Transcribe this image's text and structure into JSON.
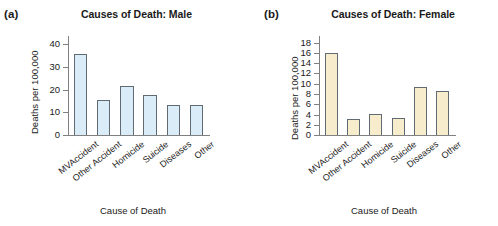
{
  "figure": {
    "panels": [
      {
        "panel_label": "(a)",
        "title": "Causes of Death: Male",
        "ylabel": "Deaths per 100,000",
        "xlabel": "Cause of Death",
        "bar_color": "#d9ecf7",
        "bar_edge_color": "#5f6a72"
      },
      {
        "panel_label": "(b)",
        "title": "Causes of Death: Female",
        "ylabel": "Deaths per 100,000",
        "xlabel": "Cause of Death",
        "bar_color": "#f7edcd",
        "bar_edge_color": "#5f6a72"
      }
    ]
  },
  "chart_data": [
    {
      "type": "bar",
      "title": "Causes of Death: Male",
      "panel": "(a)",
      "xlabel": "Cause of Death",
      "ylabel": "Deaths per 100,000",
      "categories": [
        "MVAccident",
        "Other Accident",
        "Homicide",
        "Suicide",
        "Diseases",
        "Other"
      ],
      "values": [
        35.5,
        15.2,
        21.5,
        17.5,
        13.0,
        13.0
      ],
      "ylim": [
        0,
        44
      ],
      "yticks": [
        0,
        10,
        20,
        30,
        40
      ],
      "ytick_labels": [
        "0",
        "10",
        "20",
        "30",
        "40"
      ],
      "grid": false,
      "legend": false
    },
    {
      "type": "bar",
      "title": "Causes of Death: Female",
      "panel": "(b)",
      "xlabel": "Cause of Death",
      "ylabel": "Deaths per 100,000",
      "categories": [
        "MVAccident",
        "Other Accident",
        "Homicide",
        "Suicide",
        "Diseases",
        "Other"
      ],
      "values": [
        16.0,
        3.2,
        4.1,
        3.3,
        9.4,
        8.5
      ],
      "ylim": [
        0,
        19.5
      ],
      "yticks": [
        0,
        2,
        4,
        6,
        8,
        10,
        12,
        14,
        16,
        18
      ],
      "ytick_labels": [
        "0",
        "2",
        "4",
        "6",
        "8",
        "10",
        "12",
        "14",
        "16",
        "18"
      ],
      "grid": false,
      "legend": false
    }
  ]
}
